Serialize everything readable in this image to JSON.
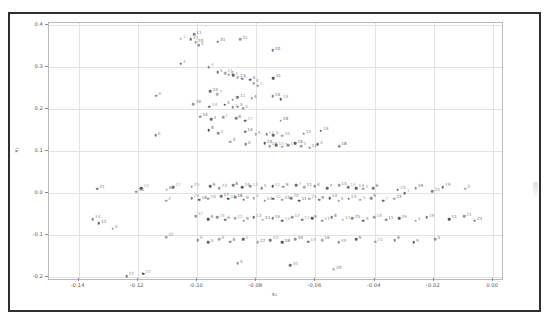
{
  "figure": {
    "background_color": "#ffffff",
    "frame_color": "#2e2e33",
    "grid_color": "#e2e2e5",
    "axes_edge_color": "#b9b9bd",
    "point_color": "#4a4a52",
    "label_color": "#5c5c63"
  },
  "chart_data": {
    "type": "scatter",
    "title": "",
    "xlabel": "x₁",
    "ylabel": "x₂",
    "xlim": [
      -0.15,
      0.003
    ],
    "ylim": [
      -0.205,
      0.405
    ],
    "grid": true,
    "legend": "none",
    "xticks": [
      -0.14,
      -0.12,
      -0.1,
      -0.08,
      -0.06,
      -0.04,
      -0.02,
      0.0
    ],
    "xticklabels": [
      "-0.14",
      "-0.12",
      "-0.10",
      "-0.08",
      "-0.06",
      "-0.04",
      "-0.02",
      "0.00"
    ],
    "yticks": [
      0.4,
      0.3,
      0.2,
      0.1,
      0.0,
      -0.1,
      -0.2
    ],
    "yticklabels": [
      "0.4",
      "0.3",
      "0.2",
      "0.1",
      "0.0",
      "-0.1",
      "-0.2"
    ],
    "point_label_mode": "integer-id-beside-marker",
    "points": [
      {
        "x": -0.1055,
        "y": 0.368,
        "label": "1"
      },
      {
        "x": -0.101,
        "y": 0.378,
        "label": "11"
      },
      {
        "x": -0.1022,
        "y": 0.366,
        "label": "31"
      },
      {
        "x": -0.1005,
        "y": 0.359,
        "label": "10"
      },
      {
        "x": -0.0995,
        "y": 0.352,
        "label": "4"
      },
      {
        "x": -0.093,
        "y": 0.36,
        "label": "31"
      },
      {
        "x": -0.0855,
        "y": 0.366,
        "label": "31"
      },
      {
        "x": -0.0745,
        "y": 0.34,
        "label": "10"
      },
      {
        "x": -0.1055,
        "y": 0.308,
        "label": "1"
      },
      {
        "x": -0.096,
        "y": 0.3,
        "label": "4"
      },
      {
        "x": -0.093,
        "y": 0.288,
        "label": "1"
      },
      {
        "x": -0.0905,
        "y": 0.286,
        "label": "11"
      },
      {
        "x": -0.0893,
        "y": 0.282,
        "label": "4"
      },
      {
        "x": -0.0878,
        "y": 0.28,
        "label": "1"
      },
      {
        "x": -0.0862,
        "y": 0.276,
        "label": "11"
      },
      {
        "x": -0.0848,
        "y": 0.272,
        "label": "1"
      },
      {
        "x": -0.082,
        "y": 0.27,
        "label": "4"
      },
      {
        "x": -0.0808,
        "y": 0.262,
        "label": "4"
      },
      {
        "x": -0.0795,
        "y": 0.256,
        "label": "1"
      },
      {
        "x": -0.0742,
        "y": 0.274,
        "label": "31"
      },
      {
        "x": -0.1138,
        "y": 0.232,
        "label": "6"
      },
      {
        "x": -0.0955,
        "y": 0.242,
        "label": "24"
      },
      {
        "x": -0.0932,
        "y": 0.236,
        "label": "7"
      },
      {
        "x": -0.088,
        "y": 0.222,
        "label": "1"
      },
      {
        "x": -0.0862,
        "y": 0.228,
        "label": "11"
      },
      {
        "x": -0.0815,
        "y": 0.226,
        "label": "4"
      },
      {
        "x": -0.0745,
        "y": 0.23,
        "label": "18"
      },
      {
        "x": -0.0718,
        "y": 0.224,
        "label": "18"
      },
      {
        "x": -0.1012,
        "y": 0.212,
        "label": "26"
      },
      {
        "x": -0.0958,
        "y": 0.206,
        "label": "14"
      },
      {
        "x": -0.0906,
        "y": 0.21,
        "label": "4"
      },
      {
        "x": -0.088,
        "y": 0.204,
        "label": "7"
      },
      {
        "x": -0.0862,
        "y": 0.206,
        "label": "5"
      },
      {
        "x": -0.0845,
        "y": 0.202,
        "label": "5"
      },
      {
        "x": -0.099,
        "y": 0.182,
        "label": "14"
      },
      {
        "x": -0.0952,
        "y": 0.176,
        "label": "4"
      },
      {
        "x": -0.0912,
        "y": 0.18,
        "label": "1"
      },
      {
        "x": -0.0868,
        "y": 0.178,
        "label": "8"
      },
      {
        "x": -0.0838,
        "y": 0.172,
        "label": "27"
      },
      {
        "x": -0.0718,
        "y": 0.172,
        "label": "18"
      },
      {
        "x": -0.114,
        "y": 0.137,
        "label": "6"
      },
      {
        "x": -0.096,
        "y": 0.15,
        "label": "8"
      },
      {
        "x": -0.0928,
        "y": 0.142,
        "label": "5"
      },
      {
        "x": -0.0838,
        "y": 0.146,
        "label": "14"
      },
      {
        "x": -0.0802,
        "y": 0.14,
        "label": "4"
      },
      {
        "x": -0.0765,
        "y": 0.14,
        "label": "11"
      },
      {
        "x": -0.0742,
        "y": 0.138,
        "label": "5"
      },
      {
        "x": -0.0712,
        "y": 0.136,
        "label": "26"
      },
      {
        "x": -0.064,
        "y": 0.141,
        "label": "11"
      },
      {
        "x": -0.0582,
        "y": 0.148,
        "label": "18"
      },
      {
        "x": -0.0888,
        "y": 0.122,
        "label": "3"
      },
      {
        "x": -0.0835,
        "y": 0.116,
        "label": "6"
      },
      {
        "x": -0.0772,
        "y": 0.118,
        "label": "24"
      },
      {
        "x": -0.0755,
        "y": 0.112,
        "label": "18"
      },
      {
        "x": -0.0732,
        "y": 0.114,
        "label": "15"
      },
      {
        "x": -0.0712,
        "y": 0.11,
        "label": "7"
      },
      {
        "x": -0.0692,
        "y": 0.114,
        "label": "11"
      },
      {
        "x": -0.0668,
        "y": 0.118,
        "label": "26"
      },
      {
        "x": -0.0648,
        "y": 0.112,
        "label": "5"
      },
      {
        "x": -0.062,
        "y": 0.108,
        "label": "12"
      },
      {
        "x": -0.0592,
        "y": 0.116,
        "label": "4"
      },
      {
        "x": -0.052,
        "y": 0.112,
        "label": "18"
      },
      {
        "x": -0.1338,
        "y": 0.01,
        "label": "31"
      },
      {
        "x": -0.1188,
        "y": 0.012,
        "label": "14"
      },
      {
        "x": -0.1205,
        "y": 0.003,
        "label": "34"
      },
      {
        "x": -0.108,
        "y": 0.014,
        "label": "27"
      },
      {
        "x": -0.1102,
        "y": 0.008,
        "label": "8"
      },
      {
        "x": -0.1018,
        "y": 0.015,
        "label": "25"
      },
      {
        "x": -0.0955,
        "y": 0.016,
        "label": "9"
      },
      {
        "x": -0.0925,
        "y": 0.012,
        "label": "23"
      },
      {
        "x": -0.0878,
        "y": 0.018,
        "label": "8"
      },
      {
        "x": -0.0848,
        "y": 0.014,
        "label": "24"
      },
      {
        "x": -0.082,
        "y": 0.016,
        "label": "13"
      },
      {
        "x": -0.0782,
        "y": 0.012,
        "label": "5"
      },
      {
        "x": -0.0745,
        "y": 0.016,
        "label": "11"
      },
      {
        "x": -0.0708,
        "y": 0.015,
        "label": "9"
      },
      {
        "x": -0.0665,
        "y": 0.018,
        "label": "7"
      },
      {
        "x": -0.0638,
        "y": 0.014,
        "label": "11"
      },
      {
        "x": -0.0602,
        "y": 0.016,
        "label": "8"
      },
      {
        "x": -0.056,
        "y": 0.012,
        "label": "7"
      },
      {
        "x": -0.052,
        "y": 0.018,
        "label": "14"
      },
      {
        "x": -0.049,
        "y": 0.014,
        "label": "14"
      },
      {
        "x": -0.0462,
        "y": 0.012,
        "label": "13"
      },
      {
        "x": -0.0438,
        "y": 0.01,
        "label": "5"
      },
      {
        "x": -0.0405,
        "y": 0.012,
        "label": "8"
      },
      {
        "x": -0.0322,
        "y": 0.008,
        "label": "23"
      },
      {
        "x": -0.0262,
        "y": 0.012,
        "label": "19"
      },
      {
        "x": -0.017,
        "y": 0.014,
        "label": "19"
      },
      {
        "x": -0.0095,
        "y": 0.01,
        "label": "2"
      },
      {
        "x": -0.0205,
        "y": 0.004,
        "label": "25"
      },
      {
        "x": -0.0298,
        "y": 0.0,
        "label": "1"
      },
      {
        "x": -0.1105,
        "y": -0.018,
        "label": "2"
      },
      {
        "x": -0.1018,
        "y": -0.012,
        "label": "24"
      },
      {
        "x": -0.0992,
        "y": -0.016,
        "label": "18"
      },
      {
        "x": -0.0962,
        "y": -0.014,
        "label": "26"
      },
      {
        "x": -0.0918,
        "y": -0.008,
        "label": "17"
      },
      {
        "x": -0.0895,
        "y": -0.014,
        "label": "22"
      },
      {
        "x": -0.0872,
        "y": -0.01,
        "label": "18"
      },
      {
        "x": -0.0842,
        "y": -0.016,
        "label": "9"
      },
      {
        "x": -0.0808,
        "y": -0.012,
        "label": "4"
      },
      {
        "x": -0.0772,
        "y": -0.018,
        "label": "13"
      },
      {
        "x": -0.0742,
        "y": -0.014,
        "label": "11"
      },
      {
        "x": -0.0712,
        "y": -0.016,
        "label": "23"
      },
      {
        "x": -0.0682,
        "y": -0.012,
        "label": "20"
      },
      {
        "x": -0.0655,
        "y": -0.018,
        "label": "11"
      },
      {
        "x": -0.0622,
        "y": -0.014,
        "label": "25"
      },
      {
        "x": -0.0588,
        "y": -0.016,
        "label": "9"
      },
      {
        "x": -0.0552,
        "y": -0.012,
        "label": "14"
      },
      {
        "x": -0.0522,
        "y": -0.018,
        "label": "8"
      },
      {
        "x": -0.0488,
        "y": -0.014,
        "label": "13"
      },
      {
        "x": -0.0448,
        "y": -0.016,
        "label": "5"
      },
      {
        "x": -0.0412,
        "y": -0.012,
        "label": "9"
      },
      {
        "x": -0.0372,
        "y": -0.018,
        "label": "7"
      },
      {
        "x": -0.0335,
        "y": -0.014,
        "label": "23"
      },
      {
        "x": -0.1352,
        "y": -0.062,
        "label": "14"
      },
      {
        "x": -0.1332,
        "y": -0.072,
        "label": "12"
      },
      {
        "x": -0.1285,
        "y": -0.085,
        "label": "4"
      },
      {
        "x": -0.1005,
        "y": -0.055,
        "label": "37"
      },
      {
        "x": -0.0962,
        "y": -0.062,
        "label": "8"
      },
      {
        "x": -0.0932,
        "y": -0.058,
        "label": "24"
      },
      {
        "x": -0.0905,
        "y": -0.064,
        "label": "6"
      },
      {
        "x": -0.0872,
        "y": -0.06,
        "label": "12"
      },
      {
        "x": -0.0842,
        "y": -0.066,
        "label": "9"
      },
      {
        "x": -0.0808,
        "y": -0.058,
        "label": "13"
      },
      {
        "x": -0.0778,
        "y": -0.064,
        "label": "11"
      },
      {
        "x": -0.0745,
        "y": -0.06,
        "label": "26"
      },
      {
        "x": -0.0712,
        "y": -0.066,
        "label": "14"
      },
      {
        "x": -0.0678,
        "y": -0.058,
        "label": "17"
      },
      {
        "x": -0.0645,
        "y": -0.064,
        "label": "11"
      },
      {
        "x": -0.0612,
        "y": -0.06,
        "label": "9"
      },
      {
        "x": -0.0578,
        "y": -0.066,
        "label": "13"
      },
      {
        "x": -0.0545,
        "y": -0.058,
        "label": "8"
      },
      {
        "x": -0.0508,
        "y": -0.064,
        "label": "11"
      },
      {
        "x": -0.0475,
        "y": -0.06,
        "label": "25"
      },
      {
        "x": -0.0438,
        "y": -0.066,
        "label": "9"
      },
      {
        "x": -0.0402,
        "y": -0.058,
        "label": "18"
      },
      {
        "x": -0.0362,
        "y": -0.064,
        "label": "11"
      },
      {
        "x": -0.0318,
        "y": -0.06,
        "label": "39"
      },
      {
        "x": -0.0262,
        "y": -0.066,
        "label": "1"
      },
      {
        "x": -0.0225,
        "y": -0.058,
        "label": "19"
      },
      {
        "x": -0.0148,
        "y": -0.062,
        "label": "11"
      },
      {
        "x": -0.0098,
        "y": -0.056,
        "label": "21"
      },
      {
        "x": -0.0062,
        "y": -0.066,
        "label": "21"
      },
      {
        "x": -0.1105,
        "y": -0.105,
        "label": "22"
      },
      {
        "x": -0.0998,
        "y": -0.112,
        "label": "8"
      },
      {
        "x": -0.0962,
        "y": -0.118,
        "label": "5"
      },
      {
        "x": -0.0925,
        "y": -0.11,
        "label": "9"
      },
      {
        "x": -0.0888,
        "y": -0.116,
        "label": "8"
      },
      {
        "x": -0.0845,
        "y": -0.11,
        "label": "4"
      },
      {
        "x": -0.0795,
        "y": -0.118,
        "label": "22"
      },
      {
        "x": -0.0752,
        "y": -0.112,
        "label": "12"
      },
      {
        "x": -0.0712,
        "y": -0.118,
        "label": "18"
      },
      {
        "x": -0.0668,
        "y": -0.11,
        "label": "39"
      },
      {
        "x": -0.0625,
        "y": -0.116,
        "label": "10"
      },
      {
        "x": -0.0578,
        "y": -0.112,
        "label": "16"
      },
      {
        "x": -0.0522,
        "y": -0.118,
        "label": "39"
      },
      {
        "x": -0.0462,
        "y": -0.11,
        "label": "9"
      },
      {
        "x": -0.0398,
        "y": -0.116,
        "label": "21"
      },
      {
        "x": -0.0332,
        "y": -0.112,
        "label": "8"
      },
      {
        "x": -0.0268,
        "y": -0.118,
        "label": "9"
      },
      {
        "x": -0.0195,
        "y": -0.11,
        "label": "5"
      },
      {
        "x": -0.1238,
        "y": -0.198,
        "label": "22"
      },
      {
        "x": -0.1182,
        "y": -0.192,
        "label": "20"
      },
      {
        "x": -0.0862,
        "y": -0.168,
        "label": "4"
      },
      {
        "x": -0.0685,
        "y": -0.172,
        "label": "30"
      },
      {
        "x": -0.0538,
        "y": -0.182,
        "label": "20"
      }
    ]
  }
}
